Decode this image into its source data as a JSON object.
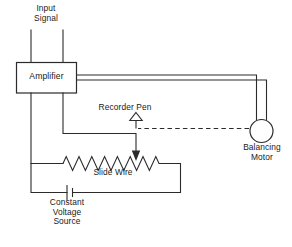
{
  "diagram": {
    "colors": {
      "wire": "#2b2b2b",
      "background": "#ffffff",
      "text": "#1a1a1a"
    },
    "labels": {
      "input_signal": "Input\nSignal",
      "amplifier": "Amplifier",
      "recorder_pen": "Recorder Pen",
      "slide_wire": "Slide Wire",
      "constant_voltage_source": "Constant\nVoltage\nSource",
      "balancing_motor": "Balancing\nMotor"
    },
    "components": {
      "amplifier_box": "Amplifier",
      "balancing_motor_circle": "Balancing Motor",
      "slide_wire_resistor": "Slide Wire",
      "battery_symbol": "Constant Voltage Source",
      "pen_arrow": "Recorder Pen",
      "wiper_arrow": "Slide Wire Wiper"
    }
  }
}
